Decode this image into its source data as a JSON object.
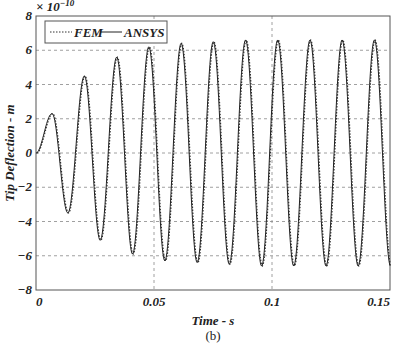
{
  "chart_data": {
    "type": "line",
    "title": "",
    "xlabel": "Time - s",
    "ylabel": "Tip Deflection - m",
    "y_multiplier": "× 10^-10",
    "caption": "(b)",
    "xlim": [
      0,
      0.15
    ],
    "ylim": [
      -8,
      8
    ],
    "xticks": [
      "0",
      "0.05",
      "0.1",
      "0.15"
    ],
    "yticks": [
      "-8",
      "-6",
      "-4",
      "-2",
      "0",
      "2",
      "4",
      "6",
      "8"
    ],
    "grid": true,
    "legend": {
      "position": "upper left",
      "entries": [
        "FEM",
        "ANSYS"
      ]
    },
    "series": [
      {
        "name": "FEM",
        "style": "dotted"
      },
      {
        "name": "ANSYS",
        "style": "solid"
      }
    ],
    "period_s": 0.01365,
    "peaks": [
      {
        "t": 0.0068,
        "y": 2.3
      },
      {
        "t": 0.0135,
        "y": -3.5
      },
      {
        "t": 0.0205,
        "y": 4.5
      },
      {
        "t": 0.0272,
        "y": -5.1
      },
      {
        "t": 0.0342,
        "y": 5.6
      },
      {
        "t": 0.0409,
        "y": -5.9
      },
      {
        "t": 0.0478,
        "y": 6.2
      },
      {
        "t": 0.0546,
        "y": -6.3
      },
      {
        "t": 0.0615,
        "y": 6.4
      },
      {
        "t": 0.0683,
        "y": -6.4
      },
      {
        "t": 0.0751,
        "y": 6.5
      },
      {
        "t": 0.0819,
        "y": -6.5
      },
      {
        "t": 0.0888,
        "y": 6.6
      },
      {
        "t": 0.0956,
        "y": -6.6
      },
      {
        "t": 0.1024,
        "y": 6.6
      },
      {
        "t": 0.1092,
        "y": -6.6
      },
      {
        "t": 0.1161,
        "y": 6.6
      },
      {
        "t": 0.1229,
        "y": -6.6
      },
      {
        "t": 0.1297,
        "y": 6.6
      },
      {
        "t": 0.1365,
        "y": -6.6
      },
      {
        "t": 0.1434,
        "y": 6.6
      }
    ],
    "end": {
      "t": 0.15,
      "y": -1.5
    }
  }
}
